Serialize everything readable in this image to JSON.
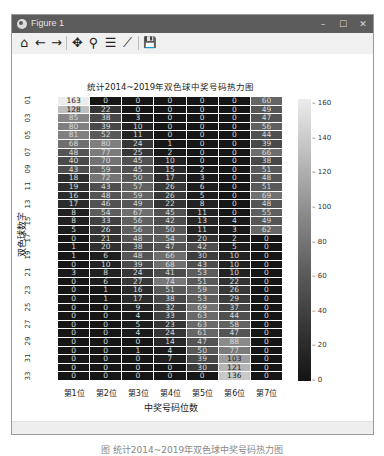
{
  "window": {
    "title": "Figure 1",
    "controls": {
      "minimize": "–",
      "maximize": "☐",
      "close": "✕"
    }
  },
  "toolbar": {
    "items": [
      {
        "name": "home",
        "glyph": "⌂"
      },
      {
        "name": "back",
        "glyph": "←"
      },
      {
        "name": "forward",
        "glyph": "→"
      },
      {
        "name": "pan",
        "glyph": "✥"
      },
      {
        "name": "zoom",
        "glyph": "⚲"
      },
      {
        "name": "subplots",
        "glyph": "☰"
      },
      {
        "name": "edit-axis",
        "glyph": "⟋"
      },
      {
        "name": "save",
        "glyph": "💾"
      }
    ]
  },
  "chart_data": {
    "type": "heatmap",
    "title": "统计2014~2019年双色球中奖号码热力图",
    "xlabel": "中奖号码位数",
    "ylabel": "双色球数字",
    "x_categories": [
      "第1位",
      "第2位",
      "第3位",
      "第4位",
      "第5位",
      "第6位",
      "第7位"
    ],
    "y_categories": [
      "01",
      "02",
      "03",
      "04",
      "05",
      "06",
      "07",
      "08",
      "09",
      "10",
      "11",
      "12",
      "13",
      "14",
      "15",
      "16",
      "17",
      "18",
      "19",
      "20",
      "21",
      "22",
      "23",
      "24",
      "25",
      "26",
      "27",
      "28",
      "29",
      "30",
      "31",
      "32",
      "33"
    ],
    "y_tick_labels": [
      "01",
      "03",
      "05",
      "07",
      "09",
      "11",
      "13",
      "15",
      "17",
      "19",
      "21",
      "23",
      "25",
      "27",
      "29",
      "31",
      "33"
    ],
    "values": [
      [
        163,
        0,
        0,
        0,
        0,
        0,
        60
      ],
      [
        128,
        22,
        0,
        0,
        0,
        0,
        49
      ],
      [
        85,
        38,
        3,
        0,
        0,
        0,
        47
      ],
      [
        80,
        39,
        10,
        0,
        0,
        0,
        56
      ],
      [
        81,
        52,
        11,
        0,
        0,
        0,
        44
      ],
      [
        68,
        80,
        24,
        1,
        0,
        0,
        39
      ],
      [
        48,
        77,
        25,
        2,
        0,
        0,
        66
      ],
      [
        40,
        70,
        45,
        10,
        0,
        0,
        38
      ],
      [
        43,
        59,
        45,
        15,
        2,
        0,
        51
      ],
      [
        18,
        72,
        50,
        17,
        3,
        0,
        48
      ],
      [
        19,
        43,
        57,
        26,
        6,
        0,
        51
      ],
      [
        16,
        48,
        59,
        26,
        5,
        0,
        69
      ],
      [
        17,
        46,
        49,
        22,
        8,
        0,
        48
      ],
      [
        8,
        54,
        67,
        45,
        11,
        0,
        55
      ],
      [
        8,
        33,
        56,
        42,
        13,
        4,
        49
      ],
      [
        5,
        26,
        56,
        50,
        11,
        3,
        62
      ],
      [
        0,
        21,
        48,
        54,
        20,
        2,
        0
      ],
      [
        1,
        20,
        38,
        47,
        42,
        5,
        0
      ],
      [
        1,
        6,
        48,
        66,
        30,
        10,
        0
      ],
      [
        0,
        10,
        39,
        68,
        43,
        10,
        0
      ],
      [
        3,
        8,
        24,
        41,
        53,
        10,
        0
      ],
      [
        0,
        6,
        27,
        74,
        51,
        22,
        0
      ],
      [
        0,
        1,
        16,
        51,
        59,
        26,
        0
      ],
      [
        0,
        1,
        17,
        38,
        53,
        29,
        0
      ],
      [
        0,
        0,
        9,
        32,
        69,
        37,
        0
      ],
      [
        0,
        0,
        4,
        33,
        63,
        44,
        0
      ],
      [
        0,
        0,
        5,
        23,
        63,
        58,
        0
      ],
      [
        0,
        0,
        4,
        24,
        61,
        47,
        0
      ],
      [
        0,
        0,
        0,
        14,
        47,
        88,
        0
      ],
      [
        0,
        0,
        1,
        4,
        50,
        77,
        0
      ],
      [
        0,
        0,
        0,
        7,
        39,
        103,
        0
      ],
      [
        0,
        0,
        0,
        0,
        30,
        121,
        0
      ],
      [
        0,
        0,
        0,
        0,
        0,
        136,
        0
      ]
    ],
    "colorbar": {
      "min": 0,
      "max": 163,
      "ticks": [
        0,
        20,
        40,
        60,
        80,
        100,
        120,
        140,
        160
      ],
      "colormap": "gray"
    },
    "annotations": "cell values shown"
  },
  "caption": "图  统计2014~2019年双色球中奖号码热力图"
}
